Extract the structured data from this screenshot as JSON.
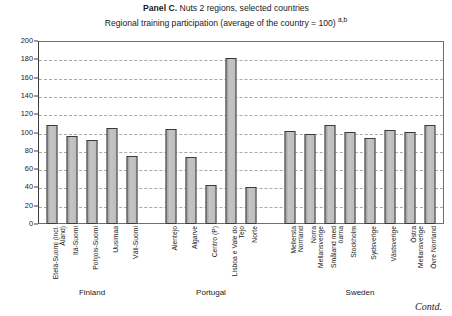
{
  "titles": {
    "panel_label": "Panel C.",
    "line1_rest": " Nuts 2 regions, selected countries",
    "line2": "Regional training participation (average of the country = 100) ",
    "line2_sup": "a,b"
  },
  "footer": {
    "contd": "Contd."
  },
  "chart_data": {
    "type": "bar",
    "title": "Panel C. Nuts 2 regions, selected countries",
    "subtitle": "Regional training participation (average of the country = 100) a,b",
    "xlabel": "",
    "ylabel": "",
    "ylim": [
      0,
      200
    ],
    "yticks": [
      0,
      20,
      40,
      60,
      80,
      100,
      120,
      140,
      160,
      180,
      200
    ],
    "grid": true,
    "legend": "none",
    "bar_color": "#b5b5b5",
    "bar_edge_color": "#3a3a3a",
    "categories": [
      "Etelä-Suomi (incl. Åland)",
      "Itä-Suomi",
      "Pohjois-Suomi",
      "Uusimaa",
      "Väli-Suomi",
      "Alentejo",
      "Algarve",
      "Centro (P)",
      "Lisboa e Vale do Tejo",
      "Norte",
      "Mellersta Norrland",
      "Norra Mellansverige",
      "Småland med öarna",
      "Stockholm",
      "Sydsverige",
      "Västsverige",
      "Östra Mellansverige",
      "Övre Norrland"
    ],
    "category_lines": [
      [
        "Etelä-Suomi (incl.",
        "Åland)"
      ],
      [
        "Itä-Suomi"
      ],
      [
        "Pohjois-Suomi"
      ],
      [
        "Uusimaa"
      ],
      [
        "Väli-Suomi"
      ],
      [
        "Alentejo"
      ],
      [
        "Algarve"
      ],
      [
        "Centro (P)"
      ],
      [
        "Lisboa e Vale do",
        "Tejo"
      ],
      [
        "Norte"
      ],
      [
        "Mellersta",
        "Norrland"
      ],
      [
        "Norra",
        "Mellansverige"
      ],
      [
        "Småland med",
        "öarna"
      ],
      [
        "Stockholm"
      ],
      [
        "Sydsverige"
      ],
      [
        "Västsverige"
      ],
      [
        "Östra",
        "Mellansverige"
      ],
      [
        "Övre Norrland"
      ]
    ],
    "values": [
      108,
      96,
      92,
      105,
      74,
      104,
      73,
      43,
      181,
      41,
      102,
      98,
      108,
      101,
      94,
      103,
      101,
      108
    ],
    "groups": [
      {
        "label": "Finland",
        "start": 0,
        "end": 4
      },
      {
        "label": "Portugal",
        "start": 5,
        "end": 9
      },
      {
        "label": "Sweden",
        "start": 10,
        "end": 17
      }
    ],
    "slot_positions": [
      {
        "center": 14,
        "width": 20
      },
      {
        "center": 34,
        "width": 20
      },
      {
        "center": 54,
        "width": 20
      },
      {
        "center": 74,
        "width": 20
      },
      {
        "center": 94,
        "width": 20
      },
      {
        "center": 133,
        "width": 20
      },
      {
        "center": 153,
        "width": 20
      },
      {
        "center": 173,
        "width": 20
      },
      {
        "center": 193,
        "width": 20
      },
      {
        "center": 213,
        "width": 20
      },
      {
        "center": 252,
        "width": 20
      },
      {
        "center": 272,
        "width": 20
      },
      {
        "center": 292,
        "width": 20
      },
      {
        "center": 312,
        "width": 20
      },
      {
        "center": 332,
        "width": 20
      },
      {
        "center": 352,
        "width": 20
      },
      {
        "center": 372,
        "width": 20
      },
      {
        "center": 392,
        "width": 20
      }
    ]
  }
}
